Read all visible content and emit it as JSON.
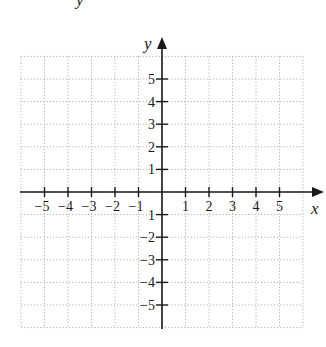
{
  "header": {
    "partial_text": "y"
  },
  "plane": {
    "x_axis_label": "x",
    "y_axis_label": "y",
    "x_range": [
      -6,
      6
    ],
    "y_range": [
      -6,
      6
    ],
    "grid": "dotted",
    "x_ticks": [
      {
        "value": -5,
        "label": "−5"
      },
      {
        "value": -4,
        "label": "−4"
      },
      {
        "value": -3,
        "label": "−3"
      },
      {
        "value": -2,
        "label": "−2"
      },
      {
        "value": -1,
        "label": "−1"
      },
      {
        "value": 1,
        "label": "1"
      },
      {
        "value": 2,
        "label": "2"
      },
      {
        "value": 3,
        "label": "3"
      },
      {
        "value": 4,
        "label": "4"
      },
      {
        "value": 5,
        "label": "5"
      }
    ],
    "y_ticks": [
      {
        "value": 5,
        "label": "5"
      },
      {
        "value": 4,
        "label": "4"
      },
      {
        "value": 3,
        "label": "3"
      },
      {
        "value": 2,
        "label": "2"
      },
      {
        "value": 1,
        "label": "1"
      },
      {
        "value": -1,
        "label": "1"
      },
      {
        "value": -2,
        "label": "−2"
      },
      {
        "value": -3,
        "label": "−3"
      },
      {
        "value": -4,
        "label": "−4"
      },
      {
        "value": -5,
        "label": "−5"
      }
    ],
    "colors": {
      "axis": "#1a1a1a",
      "grid": "#b0b0b0"
    }
  }
}
